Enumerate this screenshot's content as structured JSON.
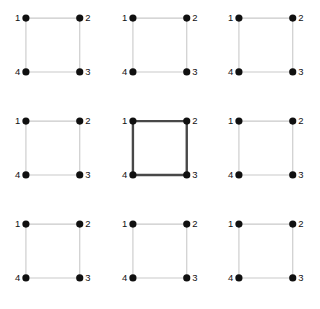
{
  "figure": {
    "type": "graph-grid",
    "title": "",
    "rows": 3,
    "columns": 3,
    "panel_count": 9
  },
  "style": {
    "background": "#ffffff",
    "node_color": "#101010",
    "edge_color_normal": "#c9c9c9",
    "edge_color_highlight": "#484848",
    "label_color": "#111111",
    "node_radius": 3.6,
    "edge_width_normal": 1.1,
    "edge_width_highlight": 2.4
  },
  "graph_template": {
    "description": "4-cycle on vertices 1-2-3-4 drawn as a square",
    "nodes": [
      {
        "id": "1",
        "label": "1",
        "x": 26,
        "y": 18,
        "label_side": "left"
      },
      {
        "id": "2",
        "label": "2",
        "x": 80,
        "y": 18,
        "label_side": "right"
      },
      {
        "id": "3",
        "label": "3",
        "x": 80,
        "y": 72,
        "label_side": "right"
      },
      {
        "id": "4",
        "label": "4",
        "x": 26,
        "y": 72,
        "label_side": "left"
      }
    ],
    "edges": [
      {
        "from": "1",
        "to": "2"
      },
      {
        "from": "2",
        "to": "3"
      },
      {
        "from": "3",
        "to": "4"
      },
      {
        "from": "4",
        "to": "1"
      }
    ]
  },
  "panels": [
    {
      "index": 0,
      "row": 1,
      "column": 1,
      "highlighted": false,
      "highlighted_edges": []
    },
    {
      "index": 1,
      "row": 1,
      "column": 2,
      "highlighted": false,
      "highlighted_edges": []
    },
    {
      "index": 2,
      "row": 1,
      "column": 3,
      "highlighted": false,
      "highlighted_edges": []
    },
    {
      "index": 3,
      "row": 2,
      "column": 1,
      "highlighted": false,
      "highlighted_edges": []
    },
    {
      "index": 4,
      "row": 2,
      "column": 2,
      "highlighted": true,
      "highlighted_edges": [
        "1-2",
        "2-3",
        "3-4",
        "4-1"
      ]
    },
    {
      "index": 5,
      "row": 2,
      "column": 3,
      "highlighted": false,
      "highlighted_edges": []
    },
    {
      "index": 6,
      "row": 3,
      "column": 1,
      "highlighted": false,
      "highlighted_edges": []
    },
    {
      "index": 7,
      "row": 3,
      "column": 2,
      "highlighted": false,
      "highlighted_edges": []
    },
    {
      "index": 8,
      "row": 3,
      "column": 3,
      "highlighted": false,
      "highlighted_edges": []
    }
  ]
}
